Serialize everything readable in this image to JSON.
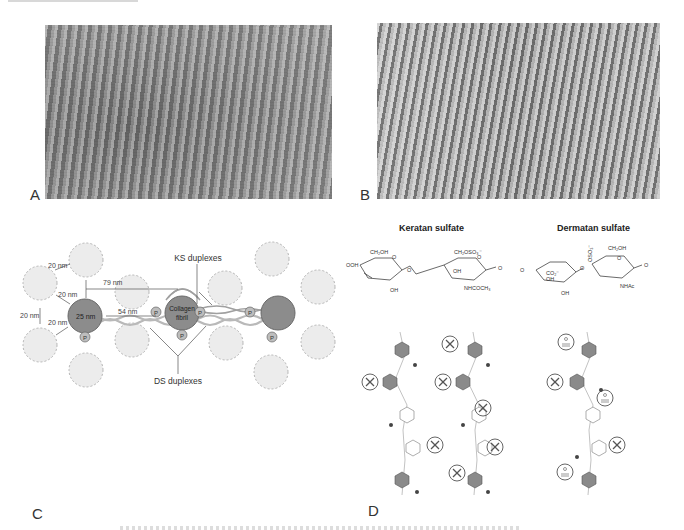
{
  "figure": {
    "panels": {
      "A": {
        "label": "A",
        "type": "electron-micrograph"
      },
      "B": {
        "label": "B",
        "type": "electron-micrograph"
      },
      "C": {
        "label": "C",
        "type": "schematic",
        "annotations": {
          "ks_duplexes": "KS duplexes",
          "ds_duplexes": "DS duplexes",
          "collagen_fibril": [
            "Collagen",
            "fibril"
          ],
          "fibril_diameter": "25 nm",
          "gap_20_a": "20 nm",
          "gap_20_b": "20 nm",
          "gap_20_c": "20 nm",
          "gap_20_d": "20 nm",
          "dist_79": "79 nm",
          "dist_54": "54 nm",
          "proteoglycan_marker": "P"
        }
      },
      "D": {
        "label": "D",
        "type": "chemical-structure",
        "titles": {
          "keratan": "Keratan sulfate",
          "dermatan": "Dermatan sulfate"
        },
        "keratan_groups": {
          "ch2oh": "CH₂OH",
          "ch2oso3": "CH₂OSO₃⁻",
          "oh_left": "OH",
          "oh_ring": "OH",
          "oh_bottom": "OH",
          "nhcoch3": "NHCOCH₃",
          "o": "O"
        },
        "dermatan_groups": {
          "ch2oh": "CH₂OH",
          "oso3": "OSO₃⁻",
          "co2": "CO₂⁻",
          "oh_ring": "OH",
          "oh_bottom": "OH",
          "nhac": "NHAc",
          "o": "O"
        }
      }
    },
    "colors": {
      "fibril_fill": "#8c8c8c",
      "dashed_circle_fill": "#ececec",
      "dashed_circle_stroke": "#b5b5b5",
      "duplex_stroke": "#a8a8a8",
      "text": "#333333"
    }
  }
}
